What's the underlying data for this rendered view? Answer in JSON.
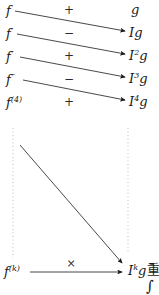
{
  "figure": {
    "ink_color": "#1a1a1a",
    "background_color": "#ffffff",
    "dotted_line_color": "#b5b5b5"
  },
  "derivative_column": {
    "header_note": "derivatives of f",
    "rows": [
      {
        "base": "f",
        "sup": ""
      },
      {
        "base": "f",
        "sup": "′"
      },
      {
        "base": "f",
        "sup": "″"
      },
      {
        "base": "f",
        "sup": "‴"
      },
      {
        "base": "f",
        "sup": "(4)"
      },
      {
        "base": "f",
        "sup": "(k)"
      }
    ]
  },
  "integral_column": {
    "header_note": "antiderivatives of g",
    "rows": [
      {
        "base": "g",
        "sup": ""
      },
      {
        "base": "Ig",
        "sup": ""
      },
      {
        "base": "I",
        "sup": "2",
        "tail": "g"
      },
      {
        "base": "I",
        "sup": "3",
        "tail": "g"
      },
      {
        "base": "I",
        "sup": "4",
        "tail": "g"
      },
      {
        "base": "I",
        "sup": "k",
        "tail": "g"
      }
    ]
  },
  "signs": {
    "labels": [
      "+",
      "−",
      "+",
      "−",
      "+"
    ],
    "final_operator": "×"
  },
  "trailing_text": {
    "cjk_fragment": "重",
    "integral_fragment": "∫"
  }
}
